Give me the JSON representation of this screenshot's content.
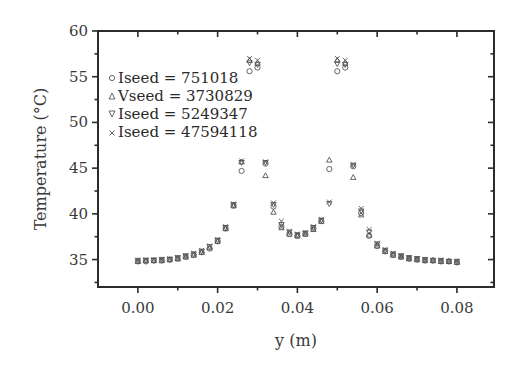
{
  "chart_data": {
    "type": "scatter",
    "title": "",
    "xlabel": "y (m)",
    "ylabel": "Temperature (°C)",
    "xlim": [
      -0.01,
      0.0893
    ],
    "ylim": [
      32,
      60
    ],
    "grid": false,
    "legend_position": "upper left (inside)",
    "xticks": [
      0.0,
      0.02,
      0.04,
      0.06,
      0.08
    ],
    "xtick_labels": [
      "0.00",
      "0.02",
      "0.04",
      "0.06",
      "0.08"
    ],
    "yticks": [
      35,
      40,
      45,
      50,
      55,
      60
    ],
    "ytick_labels": [
      "35",
      "40",
      "45",
      "50",
      "55",
      "60"
    ],
    "x": [
      0.0,
      0.002,
      0.004,
      0.006,
      0.008,
      0.01,
      0.012,
      0.014,
      0.016,
      0.018,
      0.02,
      0.022,
      0.024,
      0.026,
      0.028,
      0.03,
      0.032,
      0.034,
      0.036,
      0.038,
      0.04,
      0.042,
      0.044,
      0.046,
      0.048,
      0.05,
      0.052,
      0.054,
      0.056,
      0.058,
      0.06,
      0.062,
      0.064,
      0.066,
      0.068,
      0.07,
      0.072,
      0.074,
      0.076,
      0.078,
      0.08
    ],
    "series": [
      {
        "name": "Iseed = 751018",
        "marker": "circle",
        "values": [
          34.8,
          34.8,
          34.9,
          34.9,
          35.0,
          35.1,
          35.3,
          35.5,
          35.8,
          36.2,
          37.0,
          38.4,
          40.9,
          44.7,
          55.6,
          56.0,
          45.5,
          40.8,
          38.6,
          37.8,
          37.6,
          37.8,
          38.4,
          39.2,
          44.9,
          55.6,
          56.0,
          45.2,
          40.1,
          37.6,
          36.5,
          35.9,
          35.5,
          35.3,
          35.1,
          35.0,
          34.9,
          34.9,
          34.8,
          34.8,
          34.7
        ]
      },
      {
        "name": "Vseed = 3730829",
        "marker": "triangle-up",
        "values": [
          34.8,
          34.9,
          34.9,
          34.9,
          35.0,
          35.1,
          35.3,
          35.5,
          35.8,
          36.3,
          37.0,
          38.4,
          40.9,
          45.7,
          56.8,
          56.5,
          44.2,
          40.2,
          38.5,
          37.8,
          37.6,
          37.8,
          38.3,
          39.2,
          45.9,
          56.8,
          56.5,
          44.0,
          39.9,
          37.7,
          36.5,
          35.9,
          35.5,
          35.3,
          35.1,
          35.0,
          34.9,
          34.9,
          34.8,
          34.8,
          34.7
        ]
      },
      {
        "name": "Iseed = 5249347",
        "marker": "triangle-down",
        "values": [
          34.9,
          34.9,
          34.9,
          35.0,
          35.0,
          35.2,
          35.4,
          35.6,
          35.9,
          36.4,
          37.1,
          38.5,
          41.0,
          45.6,
          56.5,
          56.3,
          45.6,
          41.0,
          38.8,
          38.0,
          37.7,
          37.9,
          38.5,
          39.3,
          41.1,
          56.4,
          56.3,
          45.3,
          40.3,
          38.0,
          36.7,
          36.0,
          35.6,
          35.4,
          35.2,
          35.1,
          35.0,
          34.9,
          34.9,
          34.8,
          34.8
        ]
      },
      {
        "name": "Iseed = 47594118",
        "marker": "x",
        "values": [
          34.9,
          35.0,
          35.0,
          35.0,
          35.1,
          35.2,
          35.4,
          35.7,
          36.0,
          36.5,
          37.2,
          38.6,
          41.1,
          45.8,
          57.0,
          56.8,
          45.7,
          41.2,
          39.2,
          38.1,
          37.8,
          37.9,
          38.6,
          39.4,
          41.3,
          57.0,
          56.8,
          45.4,
          40.6,
          38.3,
          36.8,
          36.1,
          35.7,
          35.4,
          35.2,
          35.1,
          35.0,
          34.9,
          34.9,
          34.8,
          34.8
        ]
      }
    ]
  },
  "legend": {
    "items": [
      {
        "symbol": "circle",
        "label": "Iseed = 751018"
      },
      {
        "symbol": "triangle-up",
        "label": "Vseed = 3730829"
      },
      {
        "symbol": "triangle-down",
        "label": "Iseed = 5249347"
      },
      {
        "symbol": "x",
        "label": "Iseed = 47594118"
      }
    ]
  },
  "colors": {
    "axis": "#2b2b2b",
    "text": "#3a3a3a",
    "marker": "#555555",
    "background": "#ffffff"
  }
}
